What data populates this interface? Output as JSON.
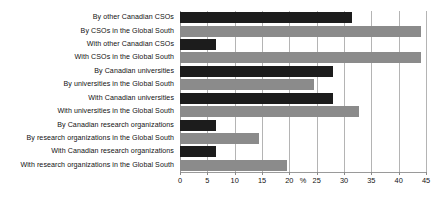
{
  "chart_data": {
    "type": "bar",
    "orientation": "horizontal",
    "title": "",
    "subtitle": "",
    "xlabel": "%",
    "ylabel": "",
    "xlim": [
      0,
      45
    ],
    "xticks": [
      0,
      5,
      10,
      15,
      20,
      25,
      30,
      35,
      40,
      45
    ],
    "xtick_labels": [
      "0",
      "5",
      "10",
      "15",
      "20",
      "25",
      "30",
      "35",
      "40",
      "45"
    ],
    "unit_label": "%",
    "unit_label_position": 22.5,
    "grid": "vertical",
    "legend": "none",
    "categories": [
      "By other Canadian CSOs",
      "By CSOs in the Global South",
      "With other Canadian CSOs",
      "With CSOs in the Global South",
      "By Canadian universities",
      "By universities in the Global South",
      "With Canadian universities",
      "With universities in the Global South",
      "By Canadian research organizations",
      "By research organizations in the Global South",
      "With Canadian research organizations",
      "With research organizations in the Global South"
    ],
    "values": [
      31.4,
      44.0,
      6.5,
      44.0,
      28.0,
      24.6,
      28.0,
      32.7,
      6.5,
      14.5,
      6.5,
      19.5
    ],
    "bar_colors": [
      "dark",
      "light",
      "dark",
      "light",
      "dark",
      "light",
      "dark",
      "light",
      "dark",
      "light",
      "dark",
      "light"
    ],
    "colors": {
      "dark": "#1c1c1c",
      "light": "#8b8b8b",
      "grid": "#b4b4b4",
      "axis": "#9a9a9a",
      "background": "#ffffff",
      "text": "#121212"
    }
  }
}
